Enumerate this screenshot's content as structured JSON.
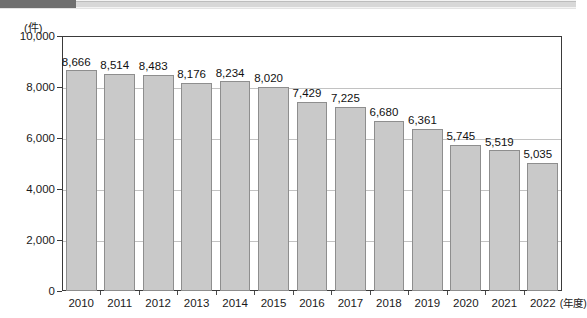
{
  "page": {
    "top_band": {
      "artifact": true
    }
  },
  "chart_data": {
    "type": "bar",
    "title": "",
    "subtitle": "",
    "xlabel": "(年度)",
    "ylabel": "(件)",
    "unit_label": "(件)",
    "x_unit_label": "(年度)",
    "categories": [
      "2010",
      "2011",
      "2012",
      "2013",
      "2014",
      "2015",
      "2016",
      "2017",
      "2018",
      "2019",
      "2020",
      "2021",
      "2022"
    ],
    "values": [
      8666,
      8514,
      8483,
      8176,
      8234,
      8020,
      7429,
      7225,
      6680,
      6361,
      5745,
      5519,
      5035
    ],
    "value_labels": [
      "8,666",
      "8,514",
      "8,483",
      "8,176",
      "8,234",
      "8,020",
      "7,429",
      "7,225",
      "6,680",
      "6,361",
      "5,745",
      "5,519",
      "5,035"
    ],
    "ylim": [
      0,
      10000
    ],
    "yticks": [
      0,
      2000,
      4000,
      6000,
      8000,
      10000
    ],
    "ytick_labels": [
      "0",
      "2,000",
      "4,000",
      "6,000",
      "8,000",
      "10,000"
    ],
    "grid": true,
    "grid_axis": "y",
    "legend": null,
    "legend_position": "none",
    "colors": {
      "bar_fill": "#c9c9c9",
      "bar_border": "#8e8e8e",
      "plot_border": "#3a3a3a",
      "gridline": "#c2c2c2",
      "text": "#111111",
      "background": "#ffffff"
    }
  }
}
